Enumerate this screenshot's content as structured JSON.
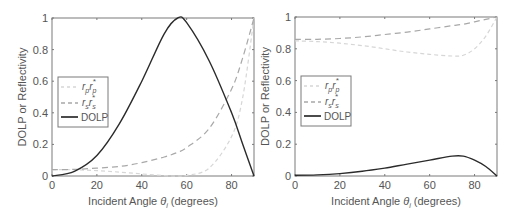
{
  "chart_data": [
    {
      "type": "line",
      "title": "",
      "xlabel": "Incident Angle θi (degrees)",
      "ylabel": "DOLP or Reflectivity",
      "xlim": [
        0,
        90
      ],
      "ylim": [
        0,
        1
      ],
      "xticks": [
        0,
        20,
        40,
        60,
        80
      ],
      "yticks": [
        0,
        0.2,
        0.4,
        0.6,
        0.8,
        1
      ],
      "xtick_labels": [
        "0",
        "20",
        "40",
        "60",
        "80"
      ],
      "ytick_labels": [
        "0",
        "0.2",
        "0.4",
        "0.6",
        "0.8",
        "1"
      ],
      "grid": false,
      "legend_position": "center-left",
      "x": [
        0,
        10,
        20,
        30,
        40,
        50,
        56,
        60,
        70,
        80,
        85,
        90
      ],
      "series": [
        {
          "name": "r_p r_p*",
          "style": "dotted-light",
          "color": "#d8d8d8",
          "values": [
            0.04,
            0.039,
            0.034,
            0.025,
            0.013,
            0.002,
            0.0,
            0.004,
            0.05,
            0.25,
            0.5,
            1.0
          ]
        },
        {
          "name": "r_s r_s*",
          "style": "dashed",
          "color": "#aaaaaa",
          "values": [
            0.04,
            0.042,
            0.05,
            0.06,
            0.085,
            0.12,
            0.15,
            0.18,
            0.3,
            0.55,
            0.75,
            1.0
          ]
        },
        {
          "name": "DOLP",
          "style": "solid",
          "color": "#333333",
          "values": [
            0.0,
            0.03,
            0.13,
            0.33,
            0.6,
            0.9,
            1.0,
            0.97,
            0.73,
            0.4,
            0.2,
            0.0
          ]
        }
      ]
    },
    {
      "type": "line",
      "title": "",
      "xlabel": "Incident Angle θi (degrees)",
      "ylabel": "DOLP or Reflectivity",
      "xlim": [
        0,
        90
      ],
      "ylim": [
        0,
        1
      ],
      "xticks": [
        0,
        20,
        40,
        60,
        80
      ],
      "yticks": [
        0,
        0.2,
        0.4,
        0.6,
        0.8,
        1
      ],
      "xtick_labels": [
        "0",
        "20",
        "40",
        "60",
        "80"
      ],
      "ytick_labels": [
        "0",
        "0.2",
        "0.4",
        "0.6",
        "0.8",
        "1"
      ],
      "grid": false,
      "legend_position": "center-left",
      "x": [
        0,
        10,
        20,
        30,
        40,
        50,
        60,
        70,
        75,
        80,
        85,
        90
      ],
      "series": [
        {
          "name": "r_p r_p*",
          "style": "dotted-light",
          "color": "#d8d8d8",
          "values": [
            0.85,
            0.845,
            0.835,
            0.82,
            0.8,
            0.78,
            0.765,
            0.755,
            0.76,
            0.8,
            0.88,
            1.0
          ]
        },
        {
          "name": "r_s r_s*",
          "style": "dashed",
          "color": "#aaaaaa",
          "values": [
            0.86,
            0.86,
            0.865,
            0.875,
            0.89,
            0.905,
            0.925,
            0.945,
            0.955,
            0.97,
            0.985,
            1.0
          ]
        },
        {
          "name": "DOLP",
          "style": "solid",
          "color": "#333333",
          "values": [
            0.005,
            0.007,
            0.015,
            0.03,
            0.05,
            0.075,
            0.1,
            0.125,
            0.125,
            0.1,
            0.06,
            0.0
          ]
        }
      ]
    }
  ],
  "panels": [
    {
      "ylabel": "DOLP or Reflectivity",
      "xlabel_prefix": "Incident Angle ",
      "xlabel_symbol": "θ",
      "xlabel_sub": "i",
      "xlabel_suffix": " (degrees)",
      "legend": [
        "r_p r_p*",
        "r_s r_s*",
        "DOLP"
      ]
    },
    {
      "ylabel": "DOLP or Reflectivity",
      "xlabel_prefix": "Incident Angle ",
      "xlabel_symbol": "θ",
      "xlabel_sub": "i",
      "xlabel_suffix": " (degrees)",
      "legend": [
        "r_p r_p*",
        "r_s r_s*",
        "DOLP"
      ]
    }
  ],
  "legend_labels": {
    "rp_main": "r",
    "rp_sub": "p",
    "rp_main2": "r",
    "rp_sub2": "p",
    "rp_star": "*",
    "rs_main": "r",
    "rs_sub": "s",
    "rs_main2": "r",
    "rs_sub2": "s",
    "rs_star": "*",
    "dolp": "DOLP"
  }
}
